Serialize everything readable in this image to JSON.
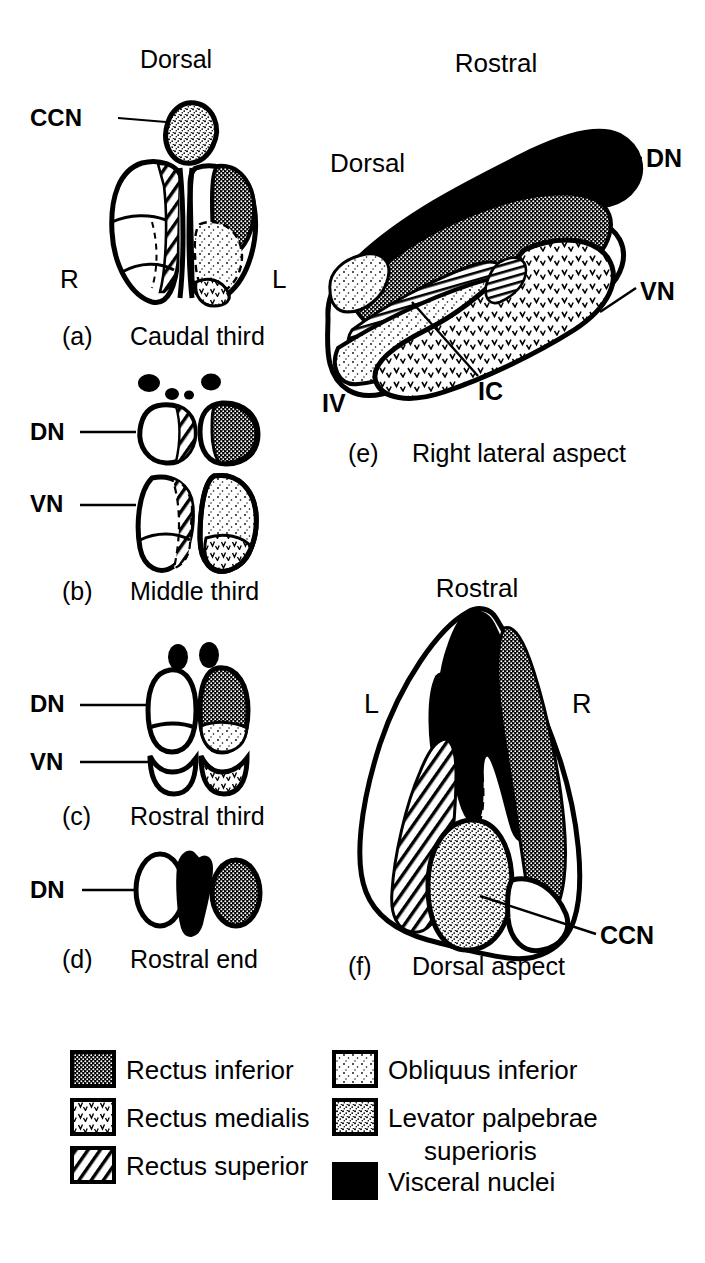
{
  "figure": {
    "kind": "anatomical-diagram",
    "background": "#ffffff",
    "ink": "#000000"
  },
  "panels": [
    {
      "id": "a",
      "letter": "(a)",
      "caption": "Caudal third",
      "orientation_labels": [
        "Dorsal",
        "R",
        "L"
      ],
      "pointer_labels": [
        "CCN"
      ]
    },
    {
      "id": "b",
      "letter": "(b)",
      "caption": "Middle third",
      "orientation_labels": [],
      "pointer_labels": [
        "DN",
        "VN"
      ]
    },
    {
      "id": "c",
      "letter": "(c)",
      "caption": "Rostral third",
      "orientation_labels": [],
      "pointer_labels": [
        "DN",
        "VN"
      ]
    },
    {
      "id": "d",
      "letter": "(d)",
      "caption": "Rostral end",
      "orientation_labels": [],
      "pointer_labels": [
        "DN"
      ]
    },
    {
      "id": "e",
      "letter": "(e)",
      "caption": "Right lateral aspect",
      "orientation_labels": [
        "Rostral",
        "Dorsal",
        "IV"
      ],
      "pointer_labels": [
        "DN",
        "VN",
        "IC"
      ]
    },
    {
      "id": "f",
      "letter": "(f)",
      "caption": "Dorsal aspect",
      "orientation_labels": [
        "Rostral",
        "L",
        "R"
      ],
      "pointer_labels": [
        "CCN"
      ]
    }
  ],
  "labels": {
    "dorsal": "Dorsal",
    "rostral": "Rostral",
    "ccn": "CCN",
    "dn": "DN",
    "vn": "VN",
    "ic": "IC",
    "iv": "IV",
    "r": "R",
    "l": "L",
    "caption_a": "Caudal third",
    "caption_b": "Middle third",
    "caption_c": "Rostral third",
    "caption_d": "Rostral end",
    "caption_e": "Right lateral aspect",
    "caption_f": "Dorsal aspect",
    "letter_a": "(a)",
    "letter_b": "(b)",
    "letter_c": "(c)",
    "letter_d": "(d)",
    "letter_e": "(e)",
    "letter_f": "(f)"
  },
  "legend": {
    "columns": 2,
    "left_items": [
      {
        "pattern": "cross-hatch-dots",
        "label": "Rectus inferior"
      },
      {
        "pattern": "chevron-ticks",
        "label": "Rectus medialis"
      },
      {
        "pattern": "diagonal-lines",
        "label": "Rectus superior"
      }
    ],
    "right_items": [
      {
        "pattern": "sparse-stipple",
        "label": "Obliquus inferior"
      },
      {
        "pattern": "dense-stipple",
        "label": "Levator palpebrae"
      },
      {
        "pattern": "dense-stipple-cont",
        "label": "superioris"
      },
      {
        "pattern": "solid-black",
        "label": "Visceral nuclei"
      }
    ]
  }
}
